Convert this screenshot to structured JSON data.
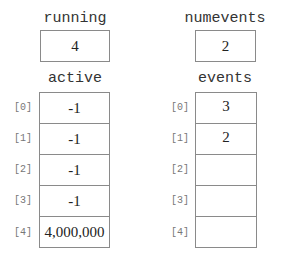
{
  "variables": {
    "running": {
      "name": "running",
      "value": "4"
    },
    "numevents": {
      "name": "numevents",
      "value": "2"
    }
  },
  "arrays": {
    "active": {
      "name": "active",
      "indices": [
        "[0]",
        "[1]",
        "[2]",
        "[3]",
        "[4]"
      ],
      "values": [
        "-1",
        "-1",
        "-1",
        "-1",
        "4,000,000"
      ]
    },
    "events": {
      "name": "events",
      "indices": [
        "[0]",
        "[1]",
        "[2]",
        "[3]",
        "[4]"
      ],
      "values": [
        "3",
        "2",
        "",
        "",
        ""
      ]
    }
  },
  "colors": {
    "border": "#8a8a8a",
    "label_text": "#333333",
    "index_text": "#777777",
    "value_text": "#222222"
  }
}
